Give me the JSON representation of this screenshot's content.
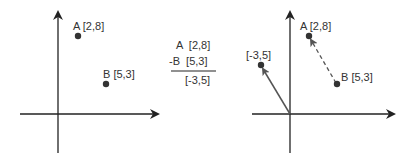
{
  "left_panel": {
    "points": [
      {
        "name": "A",
        "label": "A [2,8]",
        "coords": [
          2,
          8
        ]
      },
      {
        "name": "B",
        "label": "B [5,3]",
        "coords": [
          5,
          3
        ]
      }
    ]
  },
  "middle": {
    "line1": "A  [2,8]",
    "line2": "-B  [5,3]",
    "result": "[-3,5]"
  },
  "right_panel": {
    "points": [
      {
        "name": "A",
        "label": "A [2,8]",
        "coords": [
          2,
          8
        ]
      },
      {
        "name": "B",
        "label": "B [5,3]",
        "coords": [
          5,
          3
        ]
      },
      {
        "name": "diff",
        "label": "[-3,5]",
        "coords": [
          -3,
          5
        ]
      }
    ],
    "dashed_vector": "B to A",
    "solid_vector": "origin to [-3,5]"
  },
  "colors": {
    "axis": "#222222",
    "point": "#333333",
    "vector": "#555555",
    "text": "#333333"
  }
}
